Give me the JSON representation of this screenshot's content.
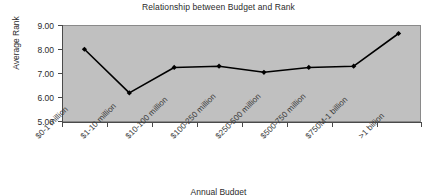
{
  "chart_data": {
    "type": "line",
    "title": "Relationship between Budget and Rank",
    "xlabel": "Annual Budget",
    "ylabel": "Average Rank",
    "categories": [
      "$0-1 million",
      "$1-10 million",
      "$10-100 million",
      "$100-250 million",
      "$250-500 million",
      "$500-750 million",
      "$750M-1 billion",
      ">1 billion"
    ],
    "values": [
      8.0,
      6.2,
      7.25,
      7.3,
      7.05,
      7.25,
      7.3,
      8.65
    ],
    "ylim": [
      5.0,
      9.0
    ],
    "ytick_step": 1.0,
    "ytick_labels": [
      "9.00",
      "8.00",
      "7.00",
      "6.00",
      "5.00"
    ],
    "grid": false,
    "legend": "none",
    "series_color": "#000000",
    "plot_background": "#c0c0c0",
    "marker": "diamond"
  }
}
